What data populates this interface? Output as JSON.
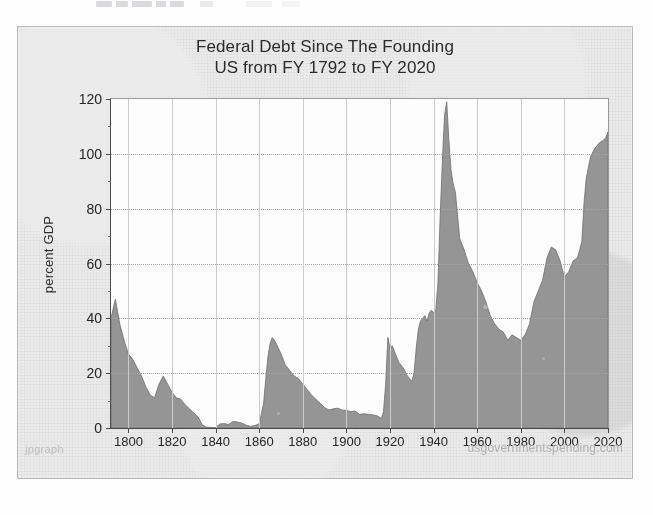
{
  "artifact": {
    "note": "clipped-text-strip"
  },
  "footer": {
    "watermark_left": "jpgraph",
    "credit_right": "usgovernmentspending.com"
  },
  "colors": {
    "area_fill": "#8c8c8c",
    "area_edge": "#6f6f6f",
    "plot_bg": "#fdfdfd",
    "card_bg": "#ebebeb",
    "axis": "#4a4a4a",
    "grid": "#c9ccd2",
    "text": "#262626"
  },
  "chart_data": {
    "type": "area",
    "title": "Federal Debt Since The Founding",
    "subtitle": "US from FY 1792 to FY 2020",
    "xlabel": "",
    "ylabel": "percent GDP",
    "ylim": [
      0,
      120
    ],
    "xlim": [
      1792,
      2020
    ],
    "yticks": [
      0,
      20,
      40,
      60,
      80,
      100,
      120
    ],
    "xticks": [
      1800,
      1820,
      1840,
      1860,
      1880,
      1900,
      1920,
      1940,
      1960,
      1980,
      2000,
      2020
    ],
    "y_minor_ticks": [
      10,
      30,
      50,
      70,
      90,
      110
    ],
    "grid": "dotted-horizontal-solid-vertical",
    "legend": null,
    "series_name": "Federal debt (percent GDP)",
    "x": [
      1792,
      1794,
      1796,
      1798,
      1800,
      1802,
      1804,
      1806,
      1808,
      1810,
      1812,
      1814,
      1816,
      1818,
      1820,
      1822,
      1824,
      1826,
      1828,
      1830,
      1832,
      1834,
      1836,
      1838,
      1840,
      1842,
      1844,
      1846,
      1848,
      1850,
      1852,
      1854,
      1856,
      1858,
      1860,
      1862,
      1863,
      1864,
      1865,
      1866,
      1867,
      1868,
      1870,
      1872,
      1874,
      1876,
      1878,
      1880,
      1882,
      1884,
      1886,
      1888,
      1890,
      1892,
      1894,
      1896,
      1898,
      1900,
      1902,
      1904,
      1906,
      1908,
      1910,
      1912,
      1914,
      1916,
      1917,
      1918,
      1919,
      1920,
      1921,
      1922,
      1924,
      1926,
      1928,
      1930,
      1931,
      1932,
      1933,
      1934,
      1935,
      1936,
      1937,
      1938,
      1939,
      1940,
      1941,
      1942,
      1943,
      1944,
      1945,
      1946,
      1947,
      1948,
      1949,
      1950,
      1952,
      1954,
      1956,
      1958,
      1960,
      1962,
      1964,
      1966,
      1968,
      1970,
      1972,
      1974,
      1976,
      1978,
      1980,
      1982,
      1984,
      1986,
      1988,
      1990,
      1992,
      1994,
      1996,
      1998,
      2000,
      2002,
      2004,
      2006,
      2008,
      2009,
      2010,
      2012,
      2014,
      2016,
      2018,
      2019,
      2020
    ],
    "values": [
      40.0,
      47.0,
      38.0,
      32.0,
      27.0,
      25.0,
      22.0,
      19.0,
      15.0,
      12.0,
      11.0,
      16.0,
      19.0,
      16.0,
      13.0,
      11.0,
      10.5,
      8.5,
      7.0,
      5.5,
      4.0,
      1.0,
      0.3,
      0.2,
      0.2,
      1.5,
      1.6,
      1.3,
      2.4,
      2.2,
      1.8,
      1.0,
      0.6,
      0.9,
      1.5,
      9.0,
      18.0,
      26.0,
      31.0,
      33.0,
      32.0,
      30.5,
      27.0,
      23.0,
      21.0,
      19.0,
      18.0,
      16.0,
      14.0,
      12.0,
      10.5,
      9.0,
      7.5,
      6.6,
      7.0,
      7.2,
      6.6,
      6.4,
      6.0,
      6.2,
      5.0,
      5.2,
      5.0,
      4.8,
      4.5,
      3.5,
      6.0,
      16.0,
      33.0,
      29.0,
      30.0,
      28.0,
      24.0,
      22.0,
      19.0,
      17.0,
      20.0,
      29.0,
      36.0,
      39.0,
      40.0,
      41.0,
      39.0,
      42.0,
      43.0,
      42.0,
      43.0,
      53.0,
      77.0,
      97.0,
      114.0,
      119.0,
      105.0,
      94.0,
      89.0,
      86.0,
      69.0,
      65.0,
      60.0,
      57.0,
      53.0,
      50.0,
      46.0,
      41.0,
      38.0,
      36.0,
      35.0,
      32.0,
      34.0,
      33.0,
      32.0,
      34.0,
      38.0,
      46.0,
      50.0,
      54.0,
      62.0,
      66.0,
      65.0,
      61.0,
      55.0,
      57.0,
      61.0,
      62.0,
      68.0,
      82.0,
      91.0,
      99.0,
      102.0,
      104.0,
      105.0,
      106.0,
      108.0
    ],
    "annotations": [
      {
        "label": "Revolutionary War debt",
        "year": 1794,
        "value": 47.0
      },
      {
        "label": "Civil War",
        "year": 1866,
        "value": 33.0
      },
      {
        "label": "World War I",
        "year": 1919,
        "value": 33.0
      },
      {
        "label": "World War II peak",
        "year": 1946,
        "value": 119.0
      },
      {
        "label": "FY 2020",
        "year": 2020,
        "value": 108.0
      }
    ]
  }
}
